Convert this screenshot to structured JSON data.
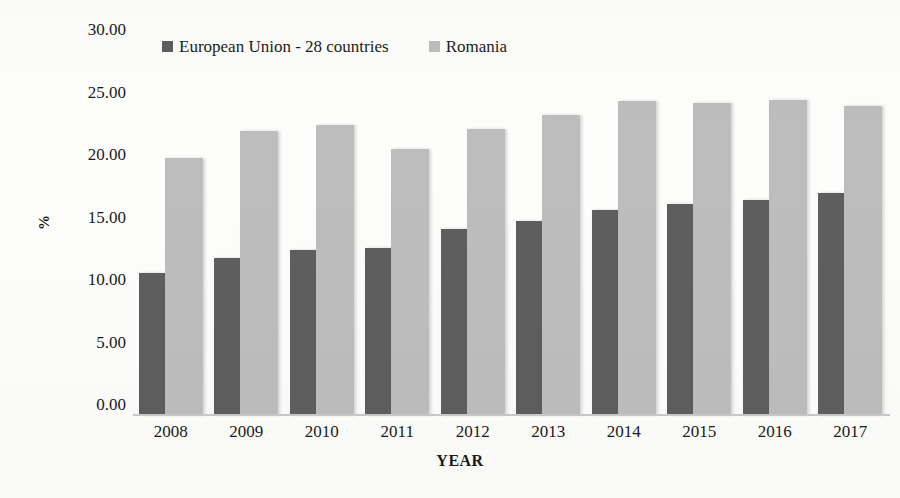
{
  "chart_data": {
    "type": "bar",
    "title": "",
    "subtitle": "",
    "xlabel": "YEAR",
    "ylabel": "%",
    "categories": [
      "2008",
      "2009",
      "2010",
      "2011",
      "2012",
      "2013",
      "2014",
      "2015",
      "2016",
      "2017"
    ],
    "series": [
      {
        "name": "European Union - 28 countries",
        "color": "#5e5e5e",
        "values": [
          11.4,
          12.6,
          13.2,
          13.4,
          14.9,
          15.5,
          16.4,
          16.9,
          17.2,
          17.8
        ]
      },
      {
        "name": "Romania",
        "color": "#bdbdbd",
        "values": [
          20.6,
          22.7,
          23.2,
          21.3,
          22.9,
          24.0,
          25.1,
          25.0,
          25.2,
          24.7
        ]
      }
    ],
    "ylim": [
      0,
      30
    ],
    "ytick_values": [
      0,
      5,
      10,
      15,
      20,
      25,
      30
    ],
    "ytick_labels": [
      "0.00",
      "5.00",
      "10.00",
      "15.00",
      "20.00",
      "25.00",
      "30.00"
    ],
    "grid": false,
    "legend_position": "top",
    "annotations": []
  },
  "legend": {
    "entries": [
      {
        "label": "European Union - 28 countries",
        "color": "#5e5e5e",
        "marker": "square-marker"
      },
      {
        "label": "Romania",
        "color": "#bdbdbd",
        "marker": "square-marker"
      }
    ]
  },
  "axes": {
    "y_title": "%",
    "x_title": "YEAR"
  }
}
